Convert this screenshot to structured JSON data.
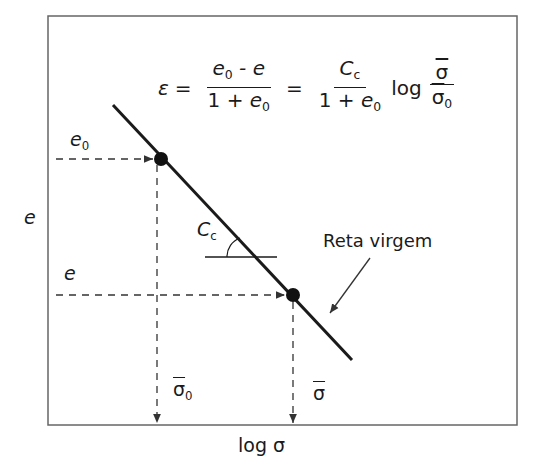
{
  "diagram": {
    "type": "consolidation-curve",
    "formula": {
      "lhs": "ε",
      "equals": "=",
      "frac1": {
        "num_base": "e",
        "num_sub": "0",
        "num_rest": " - e",
        "den_pre": "1 + ",
        "den_base": "e",
        "den_sub": "0"
      },
      "frac2": {
        "num_base": "C",
        "num_sub": "c",
        "den_pre": "1 + ",
        "den_base": "e",
        "den_sub": "0"
      },
      "log": "log",
      "frac3": {
        "num": "σ",
        "den": "σ",
        "den_sub": "0"
      }
    },
    "labels": {
      "y_axis": "e",
      "e0": {
        "base": "e",
        "sub": "0"
      },
      "e": "e",
      "cc": {
        "base": "C",
        "sub": "c"
      },
      "reta": "Reta virgem",
      "sigma0": {
        "base": "σ",
        "sub": "0"
      },
      "sigma": "σ",
      "x_axis": "log σ"
    },
    "points": [
      {
        "name": "point-e0-sigma0",
        "x": 161,
        "y": 159
      },
      {
        "name": "point-e-sigma",
        "x": 293,
        "y": 295
      }
    ],
    "colors": {
      "line": "#1a1a1a",
      "frame": "#666666",
      "dashed": "#333333"
    }
  }
}
